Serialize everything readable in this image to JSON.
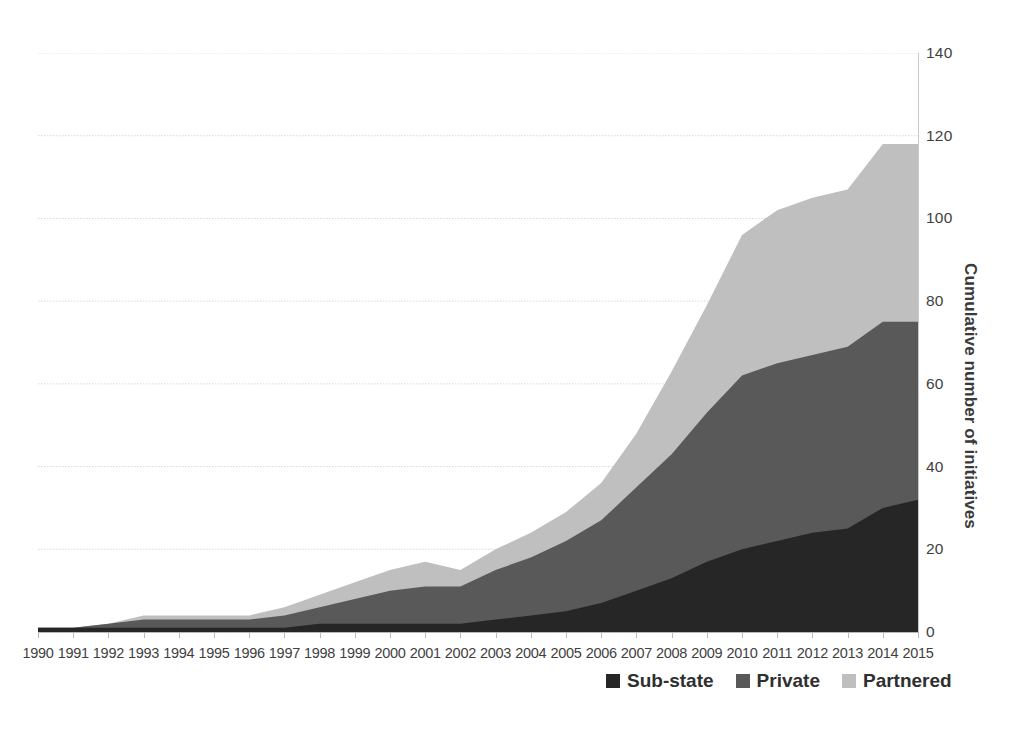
{
  "chart_data": {
    "type": "area",
    "stacked": true,
    "title": "",
    "xlabel": "",
    "ylabel": "Cumulative number of initiatives",
    "ylim": [
      0,
      140
    ],
    "ytick_step": 20,
    "yticks": [
      0,
      20,
      40,
      60,
      80,
      100,
      120,
      140
    ],
    "grid": true,
    "grid_axis": "y",
    "legend_position": "bottom-right",
    "x": [
      1990,
      1991,
      1992,
      1993,
      1994,
      1995,
      1996,
      1997,
      1998,
      1999,
      2000,
      2001,
      2002,
      2003,
      2004,
      2005,
      2006,
      2007,
      2008,
      2009,
      2010,
      2011,
      2012,
      2013,
      2014,
      2015
    ],
    "categories": [
      "1990",
      "1991",
      "1992",
      "1993",
      "1994",
      "1995",
      "1996",
      "1997",
      "1998",
      "1999",
      "2000",
      "2001",
      "2002",
      "2003",
      "2004",
      "2005",
      "2006",
      "2007",
      "2008",
      "2009",
      "2010",
      "2011",
      "2012",
      "2013",
      "2014",
      "2015"
    ],
    "series": [
      {
        "name": "Sub-state",
        "color": "#262626",
        "values": [
          1,
          1,
          1,
          1,
          1,
          1,
          1,
          1,
          2,
          2,
          2,
          2,
          2,
          3,
          4,
          5,
          7,
          10,
          13,
          17,
          20,
          22,
          24,
          25,
          30,
          32
        ]
      },
      {
        "name": "Private",
        "color": "#595959",
        "values": [
          0,
          0,
          1,
          2,
          2,
          2,
          2,
          3,
          4,
          6,
          8,
          9,
          9,
          12,
          14,
          17,
          20,
          25,
          30,
          36,
          42,
          43,
          43,
          44,
          45,
          43
        ]
      },
      {
        "name": "Partnered",
        "color": "#bfbfbf",
        "values": [
          0,
          0,
          0,
          1,
          1,
          1,
          1,
          2,
          3,
          4,
          5,
          6,
          4,
          5,
          6,
          7,
          9,
          13,
          20,
          26,
          34,
          37,
          38,
          38,
          43,
          43
        ]
      }
    ],
    "cumulative_totals": [
      1,
      1,
      2,
      4,
      4,
      4,
      4,
      6,
      9,
      12,
      15,
      17,
      15,
      20,
      24,
      29,
      36,
      48,
      63,
      79,
      96,
      102,
      105,
      107,
      118,
      118
    ]
  },
  "axes": {
    "y_title": "Cumulative number of initiatives",
    "y_tick_labels": [
      "140",
      "120",
      "100",
      "80",
      "60",
      "40",
      "20",
      "0"
    ]
  },
  "legend": {
    "items": [
      {
        "label": "Sub-state",
        "color": "#262626"
      },
      {
        "label": "Private",
        "color": "#595959"
      },
      {
        "label": "Partnered",
        "color": "#bfbfbf"
      }
    ]
  }
}
